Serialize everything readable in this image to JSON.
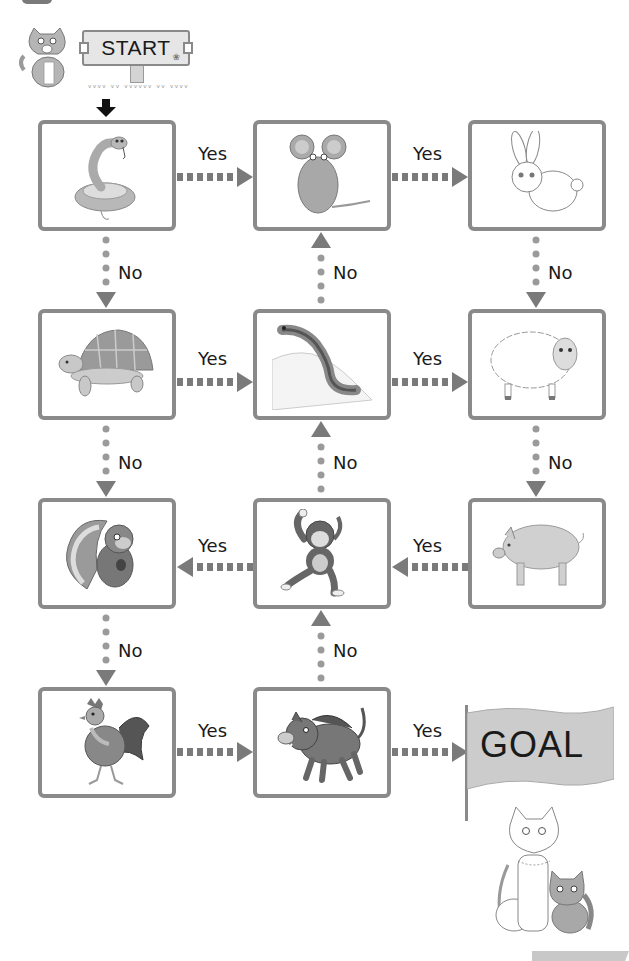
{
  "colors": {
    "box_border": "#8a8a8a",
    "connector": "#7a7a7a",
    "dot": "#9a9a9a",
    "flag_fill": "#cccccc",
    "sign_fill": "#e6e6e6",
    "text": "#1a1a1a"
  },
  "start": {
    "label": "START",
    "mascot_icon": "cat-icon",
    "arrow_icon": "down-arrow-icon"
  },
  "goal": {
    "label": "GOAL",
    "mascot_icon": "cat-pair-icon"
  },
  "nodes": [
    {
      "id": "snake",
      "row": 1,
      "col": 1,
      "icon": "snake-icon"
    },
    {
      "id": "mouse",
      "row": 1,
      "col": 2,
      "icon": "mouse-icon"
    },
    {
      "id": "rabbit",
      "row": 1,
      "col": 3,
      "icon": "rabbit-icon"
    },
    {
      "id": "tortoise",
      "row": 2,
      "col": 1,
      "icon": "tortoise-icon"
    },
    {
      "id": "salamander",
      "row": 2,
      "col": 2,
      "icon": "salamander-icon"
    },
    {
      "id": "sheep",
      "row": 2,
      "col": 3,
      "icon": "sheep-icon"
    },
    {
      "id": "squirrel",
      "row": 3,
      "col": 1,
      "icon": "squirrel-icon"
    },
    {
      "id": "monkey",
      "row": 3,
      "col": 2,
      "icon": "monkey-icon"
    },
    {
      "id": "pig",
      "row": 3,
      "col": 3,
      "icon": "pig-icon"
    },
    {
      "id": "rooster",
      "row": 4,
      "col": 1,
      "icon": "rooster-icon"
    },
    {
      "id": "boar",
      "row": 4,
      "col": 2,
      "icon": "boar-icon"
    }
  ],
  "edges": [
    {
      "from": "snake",
      "to": "mouse",
      "label": "Yes",
      "style": "dashed-bar",
      "dir": "right"
    },
    {
      "from": "mouse",
      "to": "rabbit",
      "label": "Yes",
      "style": "dashed-bar",
      "dir": "right"
    },
    {
      "from": "snake",
      "to": "tortoise",
      "label": "No",
      "style": "dotted",
      "dir": "down"
    },
    {
      "from": "salamander",
      "to": "mouse",
      "label": "No",
      "style": "dotted",
      "dir": "up"
    },
    {
      "from": "rabbit",
      "to": "sheep",
      "label": "No",
      "style": "dotted",
      "dir": "down"
    },
    {
      "from": "tortoise",
      "to": "salamander",
      "label": "Yes",
      "style": "dashed-bar",
      "dir": "right"
    },
    {
      "from": "salamander",
      "to": "sheep",
      "label": "Yes",
      "style": "dashed-bar",
      "dir": "right"
    },
    {
      "from": "tortoise",
      "to": "squirrel",
      "label": "No",
      "style": "dotted",
      "dir": "down"
    },
    {
      "from": "monkey",
      "to": "salamander",
      "label": "No",
      "style": "dotted",
      "dir": "up"
    },
    {
      "from": "sheep",
      "to": "pig",
      "label": "No",
      "style": "dotted",
      "dir": "down"
    },
    {
      "from": "monkey",
      "to": "squirrel",
      "label": "Yes",
      "style": "dashed-bar",
      "dir": "left"
    },
    {
      "from": "pig",
      "to": "monkey",
      "label": "Yes",
      "style": "dashed-bar",
      "dir": "left"
    },
    {
      "from": "squirrel",
      "to": "rooster",
      "label": "No",
      "style": "dotted",
      "dir": "down"
    },
    {
      "from": "boar",
      "to": "monkey",
      "label": "No",
      "style": "dotted",
      "dir": "up"
    },
    {
      "from": "rooster",
      "to": "boar",
      "label": "Yes",
      "style": "dashed-bar",
      "dir": "right"
    },
    {
      "from": "boar",
      "to": "goal",
      "label": "Yes",
      "style": "dashed-bar",
      "dir": "right"
    }
  ],
  "labels": {
    "yes": "Yes",
    "no": "No"
  }
}
